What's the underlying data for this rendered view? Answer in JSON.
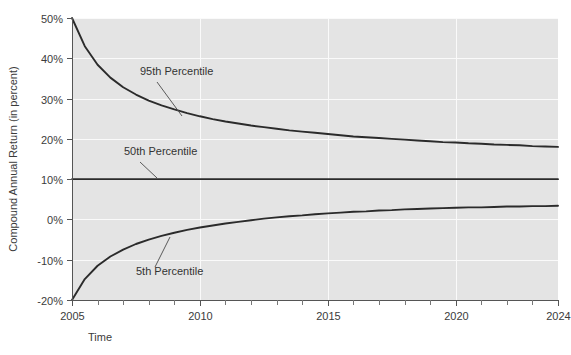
{
  "chart_data": {
    "type": "line",
    "title": "",
    "xlabel": "Time",
    "ylabel": "Compound Annual Return (in percent)",
    "xlim": [
      2005,
      2024
    ],
    "ylim": [
      -20,
      50
    ],
    "grid": true,
    "legend_position": "inline-annotations",
    "x_ticks": [
      2005,
      2006,
      2007,
      2008,
      2009,
      2010,
      2011,
      2012,
      2013,
      2014,
      2015,
      2016,
      2017,
      2018,
      2019,
      2020,
      2021,
      2022,
      2023,
      2024
    ],
    "x_tick_labels": [
      "2005",
      "",
      "",
      "",
      "",
      "2010",
      "",
      "",
      "",
      "",
      "2015",
      "",
      "",
      "",
      "",
      "2020",
      "",
      "",
      "",
      "2024"
    ],
    "y_ticks": [
      -20,
      -10,
      0,
      10,
      20,
      30,
      40,
      50
    ],
    "y_tick_labels": [
      "-20%",
      "-10%",
      "0%",
      "10%",
      "20%",
      "30%",
      "40%",
      "50%"
    ],
    "x": [
      2005,
      2005.5,
      2006,
      2006.5,
      2007,
      2007.5,
      2008,
      2008.5,
      2009,
      2009.5,
      2010,
      2010.5,
      2011,
      2011.5,
      2012,
      2012.5,
      2013,
      2013.5,
      2014,
      2014.5,
      2015,
      2015.5,
      2016,
      2016.5,
      2017,
      2017.5,
      2018,
      2018.5,
      2019,
      2019.5,
      2020,
      2020.5,
      2021,
      2021.5,
      2022,
      2022.5,
      2023,
      2023.5,
      2024
    ],
    "series": [
      {
        "name": "95th Percentile",
        "color": "#2b2b2b",
        "values": [
          50.0,
          43.0,
          38.4,
          35.2,
          32.8,
          31.0,
          29.5,
          28.3,
          27.3,
          26.4,
          25.6,
          24.9,
          24.3,
          23.8,
          23.3,
          22.9,
          22.5,
          22.1,
          21.8,
          21.5,
          21.2,
          20.9,
          20.6,
          20.4,
          20.2,
          20.0,
          19.8,
          19.6,
          19.4,
          19.2,
          19.1,
          18.9,
          18.8,
          18.6,
          18.5,
          18.4,
          18.2,
          18.1,
          18.0
        ]
      },
      {
        "name": "50th Percentile",
        "color": "#2b2b2b",
        "values": [
          10.0,
          10.0,
          10.0,
          10.0,
          10.0,
          10.0,
          10.0,
          10.0,
          10.0,
          10.0,
          10.0,
          10.0,
          10.0,
          10.0,
          10.0,
          10.0,
          10.0,
          10.0,
          10.0,
          10.0,
          10.0,
          10.0,
          10.0,
          10.0,
          10.0,
          10.0,
          10.0,
          10.0,
          10.0,
          10.0,
          10.0,
          10.0,
          10.0,
          10.0,
          10.0,
          10.0,
          10.0,
          10.0,
          10.0
        ]
      },
      {
        "name": "5th Percentile",
        "color": "#2b2b2b",
        "values": [
          -20.0,
          -14.8,
          -11.5,
          -9.2,
          -7.5,
          -6.1,
          -5.0,
          -4.1,
          -3.3,
          -2.6,
          -2.0,
          -1.5,
          -1.0,
          -0.6,
          -0.2,
          0.2,
          0.5,
          0.8,
          1.0,
          1.3,
          1.5,
          1.7,
          1.9,
          2.0,
          2.2,
          2.3,
          2.5,
          2.6,
          2.7,
          2.8,
          2.9,
          3.0,
          3.0,
          3.1,
          3.2,
          3.2,
          3.3,
          3.3,
          3.4
        ]
      }
    ],
    "annotations": [
      {
        "text": "95th Percentile",
        "label_x": 140,
        "label_y": 75,
        "leader_from_x": 157,
        "leader_from_y": 82,
        "leader_to_x": 182,
        "leader_to_y": 116
      },
      {
        "text": "50th Percentile",
        "label_x": 124,
        "label_y": 155,
        "leader_from_x": 140,
        "leader_from_y": 162,
        "leader_to_x": 157,
        "leader_to_y": 178
      },
      {
        "text": "5th Percentile",
        "label_x": 136,
        "label_y": 275,
        "leader_from_x": 155,
        "leader_from_y": 267,
        "leader_to_x": 170,
        "leader_to_y": 237
      }
    ]
  },
  "colors": {
    "plot_background": "#e4e4e4",
    "figure_background": "#ffffff",
    "gridline": "#fafafa",
    "axis": "#555555",
    "line": "#2b2b2b",
    "text": "#3b3b3b"
  }
}
